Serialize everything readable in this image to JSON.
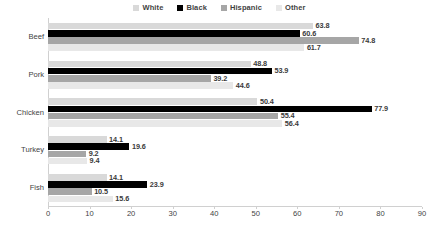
{
  "chart_data": {
    "type": "bar",
    "orientation": "horizontal",
    "title": "",
    "subtitle": "",
    "xlabel": "",
    "ylabel": "",
    "categories": [
      "Beef",
      "Pork",
      "Chicken",
      "Turkey",
      "Fish"
    ],
    "series": [
      {
        "name": "White",
        "color": "#d9d9d9",
        "values": [
          63.8,
          48.8,
          50.4,
          14.1,
          14.1
        ]
      },
      {
        "name": "Black",
        "color": "#000000",
        "values": [
          60.6,
          53.9,
          77.9,
          19.6,
          23.9
        ]
      },
      {
        "name": "Hispanic",
        "color": "#a6a6a6",
        "values": [
          74.8,
          39.2,
          55.4,
          9.2,
          10.5
        ]
      },
      {
        "name": "Other",
        "color": "#e8e8e8",
        "values": [
          61.7,
          44.6,
          56.4,
          9.4,
          15.6
        ]
      }
    ],
    "xlim": [
      0,
      90
    ],
    "xticks": [
      0,
      10,
      20,
      30,
      40,
      50,
      60,
      70,
      80,
      90
    ],
    "xtick_labels": [
      "0",
      "10",
      "20",
      "30",
      "40",
      "50",
      "60",
      "70",
      "80",
      "90"
    ],
    "grid": false,
    "data_labels": true,
    "legend": {
      "position": "top",
      "entries": [
        {
          "label": "White",
          "color": "#d9d9d9"
        },
        {
          "label": "Black",
          "color": "#000000"
        },
        {
          "label": "Hispanic",
          "color": "#a6a6a6"
        },
        {
          "label": "Other",
          "color": "#e8e8e8"
        }
      ]
    },
    "axis_color": "#d0d0d0",
    "text_color": "#3f3f3f"
  }
}
